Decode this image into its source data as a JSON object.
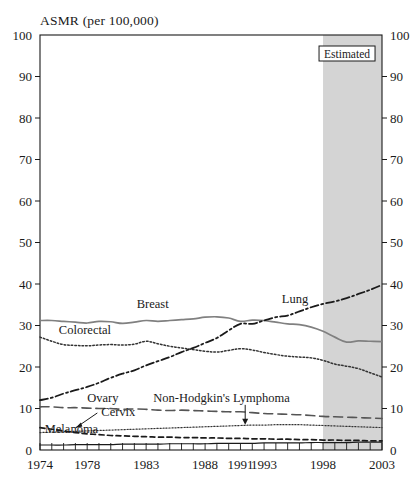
{
  "chart_data": {
    "type": "line",
    "title": "ASMR (per 100,000)",
    "xlabel": "",
    "ylabel": "ASMR (per 100,000)",
    "ylim": [
      0,
      100
    ],
    "xlim": [
      1974,
      2003
    ],
    "grid": false,
    "legend": "inline-annotations",
    "y_ticks": [
      0,
      10,
      20,
      30,
      40,
      50,
      60,
      70,
      80,
      90,
      100
    ],
    "y_tick_labels": [
      "0",
      "10",
      "20",
      "30",
      "40",
      "50",
      "60",
      "70",
      "80",
      "90",
      "100"
    ],
    "y_axis_both_sides": true,
    "x_ticks": [
      1974,
      1975,
      1976,
      1977,
      1978,
      1979,
      1980,
      1981,
      1982,
      1983,
      1984,
      1985,
      1986,
      1987,
      1988,
      1989,
      1990,
      1991,
      1992,
      1993,
      1994,
      1995,
      1996,
      1997,
      1998,
      1999,
      2000,
      2001,
      2002,
      2003
    ],
    "x_tick_labels": [
      "1974",
      "1978",
      "1983",
      "1988",
      "1991",
      "1993",
      "1998",
      "2003"
    ],
    "x_tick_label_years": [
      1974,
      1978,
      1983,
      1988,
      1991,
      1993,
      1998,
      2003
    ],
    "annotations": [
      {
        "text": "Estimated",
        "start_year": 1998,
        "end_year": 2003,
        "type": "shaded-band",
        "color": "#d4d4d4"
      }
    ],
    "x": [
      1974,
      1975,
      1976,
      1977,
      1978,
      1979,
      1980,
      1981,
      1982,
      1983,
      1984,
      1985,
      1986,
      1987,
      1988,
      1989,
      1990,
      1991,
      1992,
      1993,
      1994,
      1995,
      1996,
      1997,
      1998,
      1999,
      2000,
      2001,
      2002,
      2003
    ],
    "series": [
      {
        "name": "Breast",
        "label": "Breast",
        "style": "solid",
        "color": "#808080",
        "label_x": 1982.2,
        "label_y": 34.2,
        "values": [
          31.2,
          31.2,
          31.0,
          30.8,
          30.6,
          31.0,
          30.9,
          30.5,
          30.8,
          31.2,
          31.0,
          31.2,
          31.4,
          31.6,
          32.0,
          32.1,
          31.8,
          31.0,
          31.3,
          31.2,
          30.8,
          30.4,
          30.2,
          29.6,
          28.6,
          27.2,
          26.0,
          26.3,
          26.2,
          26.1
        ]
      },
      {
        "name": "Colorectal",
        "label": "Colorectal",
        "style": "dotted",
        "color": "#333333",
        "label_x": 1975.6,
        "label_y": 28.0,
        "values": [
          27.2,
          26.2,
          25.4,
          25.2,
          25.1,
          25.3,
          25.4,
          25.3,
          25.5,
          26.2,
          25.6,
          25.0,
          24.6,
          24.2,
          23.8,
          23.6,
          24.0,
          24.4,
          24.1,
          23.5,
          23.0,
          22.6,
          22.4,
          22.2,
          21.6,
          20.7,
          20.2,
          19.6,
          18.6,
          17.6
        ]
      },
      {
        "name": "Lung",
        "label": "Lung",
        "style": "dash-dot",
        "color": "#1a1a1a",
        "label_x": 1994.5,
        "label_y": 35.4,
        "values": [
          12.0,
          12.6,
          13.6,
          14.4,
          15.2,
          16.2,
          17.4,
          18.4,
          19.2,
          20.4,
          21.4,
          22.4,
          23.6,
          24.6,
          25.8,
          27.0,
          28.8,
          30.4,
          30.4,
          31.2,
          32.0,
          32.4,
          33.4,
          34.4,
          35.2,
          35.8,
          36.6,
          37.6,
          38.6,
          39.8
        ]
      },
      {
        "name": "Ovary",
        "label": "Ovary",
        "style": "long-dash",
        "color": "#555555",
        "label_x": 1978.0,
        "label_y": 11.6,
        "values": [
          10.4,
          10.4,
          10.2,
          10.2,
          10.1,
          10.0,
          10.0,
          9.8,
          9.9,
          9.8,
          9.6,
          9.5,
          9.6,
          9.5,
          9.4,
          9.3,
          9.2,
          9.2,
          9.0,
          8.8,
          8.7,
          8.6,
          8.5,
          8.3,
          8.1,
          8.0,
          7.9,
          7.8,
          7.7,
          7.6
        ]
      },
      {
        "name": "Non-Hodgkin's Lymphoma",
        "label": "Non-Hodgkin's Lymphoma",
        "style": "fine-dotted",
        "color": "#333333",
        "label_x": 1983.6,
        "label_y": 11.6,
        "arrow_from_year": 1991.4,
        "arrow_to_value": 6.1,
        "values": [
          4.2,
          4.3,
          4.4,
          4.5,
          4.6,
          4.7,
          4.8,
          4.9,
          5.0,
          5.1,
          5.2,
          5.3,
          5.4,
          5.5,
          5.6,
          5.7,
          5.8,
          5.9,
          6.0,
          6.0,
          6.1,
          6.1,
          6.1,
          6.0,
          5.9,
          5.8,
          5.7,
          5.6,
          5.5,
          5.4
        ]
      },
      {
        "name": "Cervix",
        "label": "Cervix",
        "style": "short-dash",
        "color": "#1a1a1a",
        "label_x": 1979.2,
        "label_y": 8.2,
        "arrow_from_year": 1977.0,
        "arrow_to_value": 5.3,
        "values": [
          5.4,
          5.0,
          4.6,
          4.2,
          3.9,
          3.7,
          3.5,
          3.4,
          3.3,
          3.2,
          3.1,
          3.1,
          3.0,
          3.0,
          2.9,
          2.9,
          2.8,
          2.8,
          2.7,
          2.7,
          2.6,
          2.6,
          2.5,
          2.5,
          2.4,
          2.4,
          2.3,
          2.3,
          2.2,
          2.2
        ]
      },
      {
        "name": "Melanoma",
        "label": "Melanoma",
        "style": "solid-thin",
        "color": "#1a1a1a",
        "label_x": 1974.4,
        "label_y": 4.0,
        "values": [
          1.2,
          1.2,
          1.2,
          1.3,
          1.3,
          1.3,
          1.3,
          1.4,
          1.4,
          1.4,
          1.4,
          1.5,
          1.5,
          1.5,
          1.5,
          1.6,
          1.6,
          1.6,
          1.6,
          1.7,
          1.7,
          1.7,
          1.7,
          1.8,
          1.8,
          1.8,
          1.8,
          1.9,
          1.9,
          1.9
        ]
      }
    ]
  }
}
